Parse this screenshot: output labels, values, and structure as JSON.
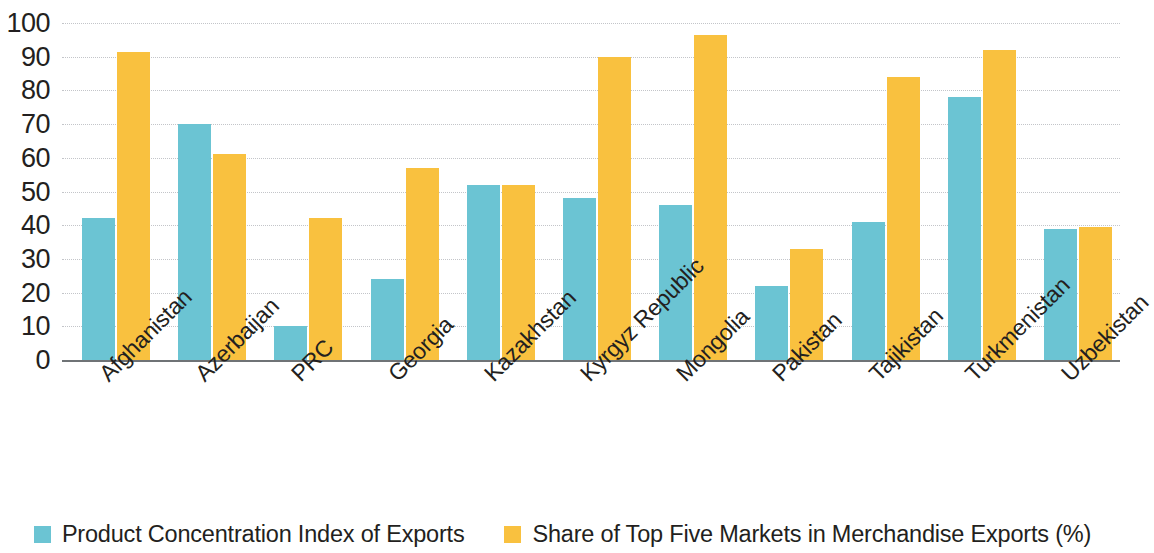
{
  "chart_data": {
    "type": "bar",
    "title": "",
    "subtitle": "",
    "xlabel": "",
    "ylabel": "",
    "ylim": [
      0,
      100
    ],
    "ytick_step": 10,
    "yticks": [
      100,
      90,
      80,
      70,
      60,
      50,
      40,
      30,
      20,
      10,
      0
    ],
    "grid": true,
    "legend_position": "bottom",
    "categories": [
      "Afghanistan",
      "Azerbaijan",
      "PRC",
      "Georgia",
      "Kazakhstan",
      "Kyrgyz Republic",
      "Mongolia",
      "Pakistan",
      "Tajikistan",
      "Turkmenistan",
      "Uzbekistan"
    ],
    "series": [
      {
        "name": "Product Concentration Index of Exports",
        "color": "#6bc4d3",
        "values": [
          42,
          70,
          10,
          24,
          52,
          48,
          46,
          22,
          41,
          78,
          39
        ]
      },
      {
        "name": "Share of Top Five Markets in Merchandise Exports (%)",
        "color": "#f9c13f",
        "values": [
          91.5,
          61,
          42,
          57,
          52,
          90,
          96.5,
          33,
          84,
          92,
          39.5
        ]
      }
    ]
  },
  "legend": {
    "items": [
      {
        "label": "Product Concentration Index of Exports",
        "color": "#6bc4d3"
      },
      {
        "label": "Share of Top Five Markets in Merchandise Exports (%)",
        "color": "#f9c13f"
      }
    ]
  },
  "colors": {
    "series_a": "#6bc4d3",
    "series_b": "#f9c13f",
    "axis": "#6f7376",
    "grid": "#b9bcc0",
    "text": "#231f20"
  }
}
